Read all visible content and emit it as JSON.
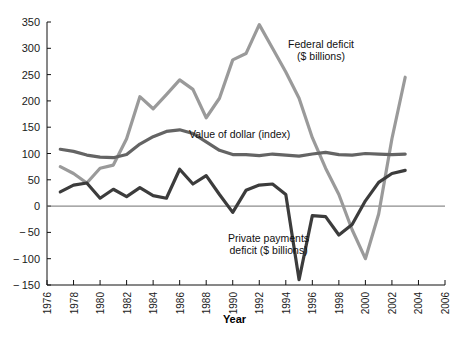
{
  "chart_data": {
    "type": "line",
    "title": "",
    "xlabel": "Year",
    "ylabel": "",
    "xlim": [
      1976,
      2006
    ],
    "ylim": [
      -150,
      350
    ],
    "grid": false,
    "legend_position": "inline-annotations",
    "yticks": [
      350,
      300,
      250,
      200,
      150,
      100,
      50,
      0,
      -50,
      -100,
      -150
    ],
    "ytick_labels": [
      "350",
      "300",
      "250",
      "200",
      "150",
      "100",
      "50",
      "0",
      "− 50",
      "− 100",
      "− 150"
    ],
    "xticks": [
      1976,
      1978,
      1980,
      1982,
      1984,
      1986,
      1988,
      1990,
      1992,
      1994,
      1996,
      1998,
      2000,
      2002,
      2004,
      2006
    ],
    "xtick_labels": [
      "1976",
      "1978",
      "1980",
      "1982",
      "1984",
      "1986",
      "1988",
      "1990",
      "1992",
      "1994",
      "1996",
      "1998",
      "2000",
      "2002",
      "2004",
      "2006"
    ],
    "x": [
      1977,
      1978,
      1979,
      1980,
      1981,
      1982,
      1983,
      1984,
      1985,
      1986,
      1987,
      1988,
      1989,
      1990,
      1991,
      1992,
      1993,
      1994,
      1995,
      1996,
      1997,
      1998,
      1999,
      2000,
      2001,
      2002,
      2003
    ],
    "series": [
      {
        "name": "Federal deficit ($ billions)",
        "color": "#9a9a9a",
        "label_text": "Federal deficit\n($ billions)",
        "values": [
          75,
          62,
          44,
          72,
          78,
          128,
          208,
          185,
          212,
          240,
          222,
          168,
          205,
          278,
          290,
          345,
          300,
          255,
          205,
          130,
          72,
          22,
          -45,
          -100,
          -15,
          128,
          245
        ]
      },
      {
        "name": "Value of dollar (index)",
        "color": "#646464",
        "label_text": "Value of dollar (index)",
        "values": [
          108,
          104,
          97,
          93,
          92,
          98,
          118,
          132,
          142,
          145,
          138,
          122,
          106,
          98,
          98,
          96,
          99,
          97,
          95,
          99,
          102,
          98,
          97,
          100,
          99,
          98,
          99
        ]
      },
      {
        "name": "Private payments deficit ($ billions)",
        "color": "#3c3c3c",
        "label_text": "Private payments\ndeficit ($ billions)",
        "values": [
          27,
          40,
          44,
          15,
          32,
          18,
          35,
          20,
          15,
          70,
          42,
          58,
          22,
          -12,
          30,
          40,
          42,
          22,
          -140,
          -18,
          -20,
          -55,
          -35,
          10,
          45,
          62,
          68
        ]
      }
    ],
    "annotations": [
      {
        "name": "federal-deficit-label",
        "text": "Federal deficit\n($ billions)",
        "line1": "Federal deficit",
        "line2": "($ billions)"
      },
      {
        "name": "value-of-dollar-label",
        "text": "Value of dollar (index)",
        "line1": "Value of dollar (index)",
        "line2": ""
      },
      {
        "name": "private-payments-label",
        "text": "Private payments\ndeficit ($ billions)",
        "line1": "Private payments",
        "line2": "deficit ($ billions)"
      }
    ],
    "zero_line": 0
  }
}
